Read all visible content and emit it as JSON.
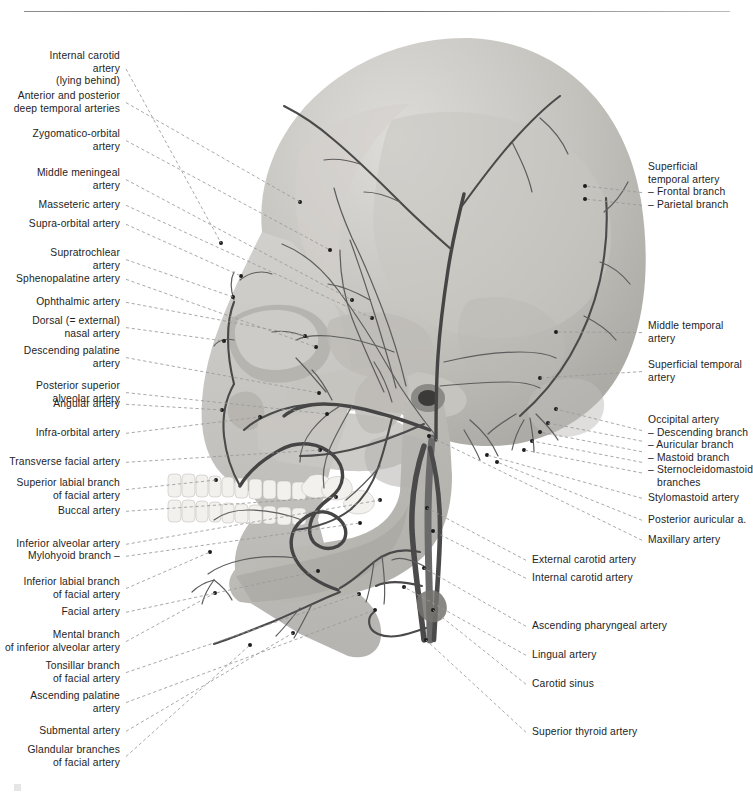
{
  "page": {
    "figure_kind": "lateral view of skull with arterial supply",
    "background_color": "#ffffff",
    "bone_color": "#c9c7c3",
    "vessel_color": "#4a4a4a",
    "leader_color": "#9a9a9a",
    "text_color": "#242424"
  },
  "labels_left": [
    {
      "id": "internal-carotid-artery",
      "lines": [
        "Internal carotid",
        "artery",
        "(lying behind)"
      ],
      "x": 120,
      "y": 50,
      "tip": [
        221,
        243
      ]
    },
    {
      "id": "deep-temporal-arteries",
      "lines": [
        "Anterior and posterior",
        "deep temporal arteries"
      ],
      "x": 120,
      "y": 90,
      "tip": [
        300,
        202
      ]
    },
    {
      "id": "zygomatico-orbital-artery",
      "lines": [
        "Zygomatico-orbital",
        "artery"
      ],
      "x": 120,
      "y": 128,
      "tip": [
        330,
        250
      ]
    },
    {
      "id": "middle-meningeal-artery",
      "lines": [
        "Middle meningeal",
        "artery"
      ],
      "x": 120,
      "y": 167,
      "tip": [
        352,
        300
      ]
    },
    {
      "id": "masseteric-artery",
      "lines": [
        "Masseteric artery"
      ],
      "x": 120,
      "y": 199,
      "tip": [
        372,
        318
      ]
    },
    {
      "id": "supra-orbital-artery",
      "lines": [
        "Supra-orbital artery"
      ],
      "x": 120,
      "y": 218,
      "tip": [
        241,
        276
      ]
    },
    {
      "id": "supratrochlear-artery",
      "lines": [
        "Supratrochlear",
        "artery"
      ],
      "x": 120,
      "y": 247,
      "tip": [
        233,
        297
      ]
    },
    {
      "id": "sphenopalatine-artery",
      "lines": [
        "Sphenopalatine artery"
      ],
      "x": 120,
      "y": 273,
      "tip": [
        316,
        347
      ]
    },
    {
      "id": "ophthalmic-artery",
      "lines": [
        "Ophthalmic artery"
      ],
      "x": 120,
      "y": 296,
      "tip": [
        305,
        336
      ]
    },
    {
      "id": "dorsal-nasal-artery",
      "lines": [
        "Dorsal (= external)",
        "nasal artery"
      ],
      "x": 120,
      "y": 315,
      "tip": [
        224,
        341
      ]
    },
    {
      "id": "descending-palatine-artery",
      "lines": [
        "Descending palatine",
        "artery"
      ],
      "x": 120,
      "y": 345,
      "tip": [
        319,
        393
      ]
    },
    {
      "id": "posterior-superior-alveolar-artery",
      "lines": [
        "Posterior superior",
        "alveolar artery"
      ],
      "x": 120,
      "y": 380,
      "tip": [
        327,
        414
      ]
    },
    {
      "id": "angular-artery",
      "lines": [
        "Angular artery"
      ],
      "x": 120,
      "y": 398,
      "tip": [
        222,
        410
      ]
    },
    {
      "id": "infra-orbital-artery",
      "lines": [
        "Infra-orbital artery"
      ],
      "x": 120,
      "y": 427,
      "tip": [
        260,
        417
      ]
    },
    {
      "id": "transverse-facial-artery",
      "lines": [
        "Transverse facial artery"
      ],
      "x": 120,
      "y": 456,
      "tip": [
        320,
        450
      ]
    },
    {
      "id": "superior-labial-branch",
      "lines": [
        "Superior labial branch",
        "of facial artery"
      ],
      "x": 120,
      "y": 477,
      "tip": [
        216,
        480
      ]
    },
    {
      "id": "buccal-artery",
      "lines": [
        "Buccal artery"
      ],
      "x": 120,
      "y": 505,
      "tip": [
        336,
        497
      ]
    },
    {
      "id": "inferior-alveolar-artery",
      "lines": [
        "Inferior alveolar artery"
      ],
      "x": 120,
      "y": 538,
      "tip": [
        380,
        500
      ]
    },
    {
      "id": "mylohyoid-branch",
      "lines": [
        "Mylohyoid branch –"
      ],
      "x": 120,
      "y": 550,
      "tip": [
        360,
        523
      ]
    },
    {
      "id": "inferior-labial-branch",
      "lines": [
        "Inferior labial branch",
        "of facial artery"
      ],
      "x": 120,
      "y": 576,
      "tip": [
        210,
        552
      ]
    },
    {
      "id": "facial-artery",
      "lines": [
        "Facial artery"
      ],
      "x": 120,
      "y": 606,
      "tip": [
        318,
        571
      ]
    },
    {
      "id": "mental-branch",
      "lines": [
        "Mental branch",
        "of inferior alveolar artery"
      ],
      "x": 120,
      "y": 629,
      "tip": [
        215,
        593
      ]
    },
    {
      "id": "tonsillar-branch",
      "lines": [
        "Tonsillar branch",
        "of facial artery"
      ],
      "x": 120,
      "y": 660,
      "tip": [
        359,
        594
      ]
    },
    {
      "id": "ascending-palatine-artery",
      "lines": [
        "Ascending palatine",
        "artery"
      ],
      "x": 120,
      "y": 690,
      "tip": [
        375,
        610
      ]
    },
    {
      "id": "submental-artery",
      "lines": [
        "Submental artery"
      ],
      "x": 120,
      "y": 725,
      "tip": [
        293,
        633
      ]
    },
    {
      "id": "glandular-branches",
      "lines": [
        "Glandular branches",
        "of facial artery"
      ],
      "x": 120,
      "y": 744,
      "tip": [
        250,
        645
      ]
    }
  ],
  "labels_right": [
    {
      "id": "superficial-temporal-artery-branches",
      "lines": [
        "Superficial",
        "temporal artery",
        "– Frontal branch",
        "– Parietal branch"
      ],
      "x": 648,
      "y": 161,
      "tips": [
        [
          585,
          186
        ],
        [
          585,
          199
        ]
      ]
    },
    {
      "id": "middle-temporal-artery",
      "lines": [
        "Middle temporal",
        "artery"
      ],
      "x": 648,
      "y": 320,
      "tips": [
        [
          556,
          332
        ]
      ]
    },
    {
      "id": "superficial-temporal-artery",
      "lines": [
        "Superficial temporal",
        "artery"
      ],
      "x": 648,
      "y": 359,
      "tips": [
        [
          540,
          378
        ]
      ]
    },
    {
      "id": "occipital-artery-group",
      "lines": [
        "Occipital artery",
        "– Descending branch",
        "– Auricular branch",
        "– Mastoid branch",
        "– Sternocleidomastoid",
        "   branches"
      ],
      "x": 648,
      "y": 414,
      "tips": [
        [
          556,
          409
        ],
        [
          548,
          423
        ],
        [
          540,
          432
        ],
        [
          532,
          441
        ],
        [
          524,
          450
        ]
      ]
    },
    {
      "id": "stylomastoid-artery",
      "lines": [
        "Stylomastoid artery"
      ],
      "x": 648,
      "y": 492,
      "tips": [
        [
          487,
          455
        ]
      ]
    },
    {
      "id": "posterior-auricular-artery",
      "lines": [
        "Posterior auricular a."
      ],
      "x": 648,
      "y": 514,
      "tips": [
        [
          497,
          462
        ]
      ]
    },
    {
      "id": "maxillary-artery",
      "lines": [
        "Maxillary artery"
      ],
      "x": 648,
      "y": 534,
      "tips": [
        [
          429,
          436
        ]
      ]
    },
    {
      "id": "external-carotid-artery",
      "lines": [
        "External carotid artery"
      ],
      "x": 532,
      "y": 554,
      "tips": [
        [
          427,
          508
        ]
      ]
    },
    {
      "id": "internal-carotid-artery-right",
      "lines": [
        "Internal carotid artery"
      ],
      "x": 532,
      "y": 572,
      "tips": [
        [
          433,
          531
        ]
      ]
    },
    {
      "id": "ascending-pharyngeal-artery",
      "lines": [
        "Ascending pharyngeal artery"
      ],
      "x": 532,
      "y": 620,
      "tips": [
        [
          424,
          568
        ]
      ]
    },
    {
      "id": "lingual-artery",
      "lines": [
        "Lingual artery"
      ],
      "x": 532,
      "y": 649,
      "tips": [
        [
          404,
          587
        ]
      ]
    },
    {
      "id": "carotid-sinus",
      "lines": [
        "Carotid sinus"
      ],
      "x": 532,
      "y": 678,
      "tips": [
        [
          433,
          610
        ]
      ]
    },
    {
      "id": "superior-thyroid-artery",
      "lines": [
        "Superior thyroid artery"
      ],
      "x": 532,
      "y": 726,
      "tips": [
        [
          426,
          640
        ]
      ]
    }
  ]
}
